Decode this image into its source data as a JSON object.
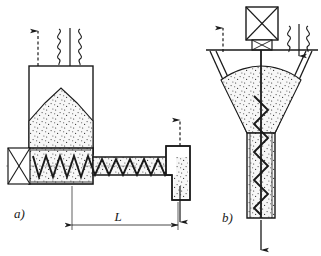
{
  "figure": {
    "background_color": "#ffffff",
    "line_color": "#1a1a1a",
    "fill_color": "#f2f2f2",
    "stipple_color": "#333333",
    "width": 321,
    "height": 256
  },
  "labels": {
    "variant_a": "a)",
    "variant_b": "b)",
    "dimension_L": "L"
  },
  "diagram_a": {
    "name": "horizontal-screw-feeder",
    "components": [
      {
        "id": "supply-hopper",
        "label": "supply hopper"
      },
      {
        "id": "material-pile",
        "label": "bulk material"
      },
      {
        "id": "screw-trough",
        "label": "screw trough"
      },
      {
        "id": "screw-flight",
        "label": "screw flight"
      },
      {
        "id": "drive-unit",
        "label": "drive unit"
      },
      {
        "id": "outlet-chute",
        "label": "outlet chute"
      },
      {
        "id": "flexible-sleeve",
        "label": "flexible sleeve"
      }
    ],
    "arrows": [
      {
        "id": "vent-arrow-inlet",
        "direction": "up",
        "style": "dashed",
        "meaning": "air vent"
      },
      {
        "id": "feed-arrow-inlet",
        "direction": "down",
        "style": "solid",
        "meaning": "material feed in"
      },
      {
        "id": "vent-arrow-outlet",
        "direction": "up",
        "style": "dashed",
        "meaning": "air vent"
      },
      {
        "id": "discharge-arrow-outlet",
        "direction": "down",
        "style": "solid",
        "meaning": "material discharge"
      }
    ],
    "screw_flight_turns": 10
  },
  "diagram_b": {
    "name": "vertical-conical-screw-feeder",
    "components": [
      {
        "id": "drive-motor",
        "label": "drive motor"
      },
      {
        "id": "bearing-block",
        "label": "bearing block"
      },
      {
        "id": "cover-plate",
        "label": "cover plate"
      },
      {
        "id": "conical-hopper",
        "label": "conical hopper"
      },
      {
        "id": "material-bed",
        "label": "bulk material"
      },
      {
        "id": "vertical-screw",
        "label": "vertical screw"
      },
      {
        "id": "discharge-tube",
        "label": "discharge tube"
      },
      {
        "id": "flexible-sleeve",
        "label": "flexible sleeve"
      }
    ],
    "arrows": [
      {
        "id": "vent-arrow-top",
        "direction": "up",
        "style": "dashed",
        "meaning": "air vent"
      },
      {
        "id": "feed-arrow-top",
        "direction": "down",
        "style": "solid",
        "meaning": "material feed in"
      },
      {
        "id": "discharge-arrow-bottom",
        "direction": "down",
        "style": "solid",
        "meaning": "material discharge"
      }
    ],
    "screw_flight_turns": 11
  }
}
